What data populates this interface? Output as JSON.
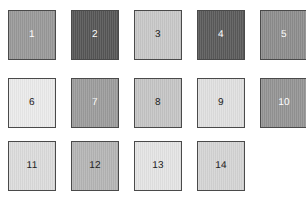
{
  "page": {
    "background_color": "#ffffff",
    "width": 306,
    "height": 200,
    "columns": 5,
    "rows": 3,
    "swatch_count": 14
  },
  "grid": {
    "swatch_width": 48,
    "swatch_height": 50,
    "column_gap": 15,
    "row_gap": 12,
    "border_color": "#4a4a4a",
    "column_x": [
      8,
      71,
      134,
      197,
      260
    ],
    "row_y": [
      10,
      78,
      141
    ]
  },
  "swatches": [
    {
      "label": "1",
      "fill": "#999999",
      "text_color": "#ffffff",
      "row": 0,
      "col": 0
    },
    {
      "label": "2",
      "fill": "#565656",
      "text_color": "#ffffff",
      "row": 0,
      "col": 1
    },
    {
      "label": "3",
      "fill": "#c8c8c8",
      "text_color": "#222222",
      "row": 0,
      "col": 2
    },
    {
      "label": "4",
      "fill": "#5a5a5a",
      "text_color": "#ffffff",
      "row": 0,
      "col": 3
    },
    {
      "label": "5",
      "fill": "#8d8d8d",
      "text_color": "#ffffff",
      "row": 0,
      "col": 4
    },
    {
      "label": "6",
      "fill": "#ebebeb",
      "text_color": "#222222",
      "row": 1,
      "col": 0
    },
    {
      "label": "7",
      "fill": "#9c9c9c",
      "text_color": "#ffffff",
      "row": 1,
      "col": 1
    },
    {
      "label": "8",
      "fill": "#c5c5c5",
      "text_color": "#222222",
      "row": 1,
      "col": 2
    },
    {
      "label": "9",
      "fill": "#e0e0e0",
      "text_color": "#222222",
      "row": 1,
      "col": 3
    },
    {
      "label": "10",
      "fill": "#949494",
      "text_color": "#ffffff",
      "row": 1,
      "col": 4
    },
    {
      "label": "11",
      "fill": "#dcdcdc",
      "text_color": "#222222",
      "row": 2,
      "col": 0
    },
    {
      "label": "12",
      "fill": "#b5b5b5",
      "text_color": "#222222",
      "row": 2,
      "col": 1
    },
    {
      "label": "13",
      "fill": "#e4e4e4",
      "text_color": "#222222",
      "row": 2,
      "col": 2
    },
    {
      "label": "14",
      "fill": "#d5d5d5",
      "text_color": "#222222",
      "row": 2,
      "col": 3
    }
  ]
}
